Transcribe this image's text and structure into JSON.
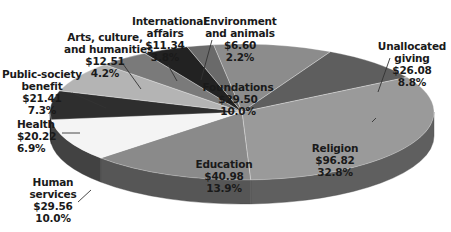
{
  "chart_data": {
    "type": "pie",
    "style": "3d-exploded-none",
    "title": "",
    "unit": "billions of dollars",
    "slices": [
      {
        "name": "Foundations",
        "value": 29.5,
        "value_label": "$29.50",
        "percent": 10.0,
        "percent_label": "10.0%",
        "color": "#8c8c8c"
      },
      {
        "name": "Unallocated giving",
        "value": 26.08,
        "value_label": "$26.08",
        "percent": 8.8,
        "percent_label": "8.8%",
        "color": "#5e5e5e"
      },
      {
        "name": "Religion",
        "value": 96.82,
        "value_label": "$96.82",
        "percent": 32.8,
        "percent_label": "32.8%",
        "color": "#9a9a9a"
      },
      {
        "name": "Education",
        "value": 40.98,
        "value_label": "$40.98",
        "percent": 13.9,
        "percent_label": "13.9%",
        "color": "#8a8a8a"
      },
      {
        "name": "Human services",
        "value": 29.56,
        "value_label": "$29.56",
        "percent": 10.0,
        "percent_label": "10.0%",
        "color": "#f4f4f4"
      },
      {
        "name": "Health",
        "value": 20.22,
        "value_label": "$20.22",
        "percent": 6.9,
        "percent_label": "6.9%",
        "color": "#2e2e2e"
      },
      {
        "name": "Public-society benefit",
        "value": 21.41,
        "value_label": "$21.41",
        "percent": 7.3,
        "percent_label": "7.3%",
        "color": "#b4b4b4"
      },
      {
        "name": "Arts, culture, and humanities",
        "value": 12.51,
        "value_label": "$12.51",
        "percent": 4.2,
        "percent_label": "4.2%",
        "color": "#7a7a7a"
      },
      {
        "name": "International affairs",
        "value": 11.34,
        "value_label": "$11.34",
        "percent": 3.8,
        "percent_label": "3.8%",
        "color": "#222222"
      },
      {
        "name": "Environment and animals",
        "value": 6.6,
        "value_label": "$6.60",
        "percent": 2.2,
        "percent_label": "2.2%",
        "color": "#6a6a6a"
      }
    ]
  },
  "labels": {
    "foundations": {
      "l1": "Foundations",
      "v": "$29.50",
      "p": "10.0%"
    },
    "unallocated": {
      "l1": "Unallocated",
      "l2": "giving",
      "v": "$26.08",
      "p": "8.8%"
    },
    "religion": {
      "l1": "Religion",
      "v": "$96.82",
      "p": "32.8%"
    },
    "education": {
      "l1": "Education",
      "v": "$40.98",
      "p": "13.9%"
    },
    "human": {
      "l1": "Human",
      "l2": "services",
      "v": "$29.56",
      "p": "10.0%"
    },
    "health": {
      "l1": "Health",
      "v": "$20.22",
      "p": "6.9%"
    },
    "public": {
      "l1": "Public-society",
      "l2": "benefit",
      "v": "$21.41",
      "p": "7.3%"
    },
    "arts": {
      "l1": "Arts, culture,",
      "l2": "and humanities",
      "v": "$12.51",
      "p": "4.2%"
    },
    "intl": {
      "l1": "International",
      "l2": "affairs",
      "v": "$11.34",
      "p": "3.8%"
    },
    "env": {
      "l1": "Environment",
      "l2": "and animals",
      "v": "$6.60",
      "p": "2.2%"
    }
  }
}
